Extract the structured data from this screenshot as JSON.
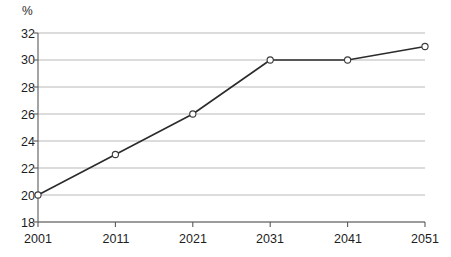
{
  "chart_data": {
    "type": "line",
    "title": "",
    "xlabel": "",
    "ylabel": "%",
    "unit_label": "%",
    "categories": [
      "2001",
      "2011",
      "2021",
      "2031",
      "2041",
      "2051"
    ],
    "x": [
      2001,
      2011,
      2021,
      2031,
      2041,
      2051
    ],
    "values": [
      20,
      23,
      26,
      30,
      30,
      31
    ],
    "series": [
      {
        "name": "",
        "values": [
          20,
          23,
          26,
          30,
          30,
          31
        ]
      }
    ],
    "ylim": [
      18,
      32
    ],
    "yticks": [
      18,
      20,
      22,
      24,
      26,
      28,
      30,
      32
    ],
    "ytick_labels": [
      "18",
      "20",
      "22",
      "24",
      "26",
      "28",
      "30",
      "32"
    ],
    "xtick_labels": [
      "2001",
      "2011",
      "2021",
      "2031",
      "2041",
      "2051"
    ],
    "grid": true,
    "grid_axis": "y",
    "legend": "none",
    "marker": "open-circle",
    "colors": {
      "line": "#2b2b2b",
      "marker_fill": "#ffffff",
      "marker_stroke": "#3c3c3c",
      "gridline": "#b9b9b9",
      "axis": "#5a5a5a",
      "text": "#1d1d1d",
      "background": "#ffffff"
    }
  }
}
